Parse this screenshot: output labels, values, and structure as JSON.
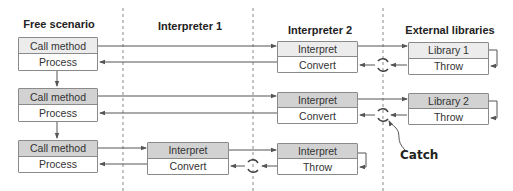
{
  "columns": [
    {
      "title": "Free scenario"
    },
    {
      "title": "Interpreter 1"
    },
    {
      "title": "Interpreter 2"
    },
    {
      "title": "External libraries"
    }
  ],
  "rows": [
    {
      "free": {
        "top": "Call method",
        "bottom": "Process"
      },
      "interp2": {
        "top": "Interpret",
        "bottom": "Convert"
      },
      "lib": {
        "top": "Library 1",
        "bottom": "Throw"
      }
    },
    {
      "free": {
        "top": "Call method",
        "bottom": "Process"
      },
      "interp2": {
        "top": "Interpret",
        "bottom": "Convert"
      },
      "lib": {
        "top": "Library 2",
        "bottom": "Throw"
      }
    },
    {
      "free": {
        "top": "Call method",
        "bottom": "Process"
      },
      "interp1": {
        "top": "Interpret",
        "bottom": "Convert"
      },
      "interp2": {
        "top": "Interpret",
        "bottom": "Throw"
      }
    }
  ],
  "annotation": {
    "label": "Catch"
  },
  "icons": {
    "cycle": "catch-cycle-icon"
  },
  "colors": {
    "light_fill": "#ececec",
    "dark_fill": "#d2d2d2",
    "stroke": "#8a8a8a",
    "line": "#555555"
  }
}
